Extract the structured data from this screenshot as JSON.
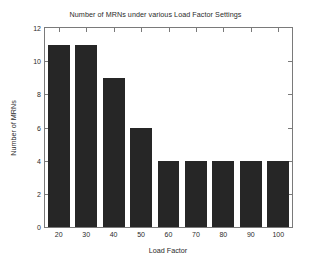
{
  "chart_data": {
    "type": "bar",
    "title": "Number of MRNs under various Load Factor Settings",
    "xlabel": "Load Factor",
    "ylabel": "Number of MRNs",
    "categories": [
      "20",
      "30",
      "40",
      "50",
      "60",
      "70",
      "80",
      "90",
      "100"
    ],
    "values": [
      11,
      11,
      9,
      6,
      4,
      4,
      4,
      4,
      4
    ],
    "ylim": [
      0,
      12
    ],
    "yticks": [
      "0",
      "2",
      "4",
      "6",
      "8",
      "10",
      "12"
    ],
    "ytick_values": [
      0,
      2,
      4,
      6,
      8,
      10,
      12
    ],
    "xticks": [
      "20",
      "30",
      "40",
      "50",
      "60",
      "70",
      "80",
      "90",
      "100"
    ],
    "grid": false,
    "legend": null,
    "bar_color": "#262626",
    "axis_color": "#7a7a7a",
    "background_color": "#ffffff",
    "text_color": "#2b2b2b"
  }
}
